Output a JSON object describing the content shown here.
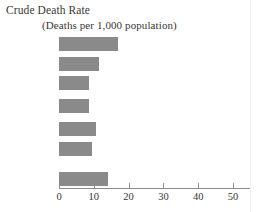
{
  "chart_data": {
    "type": "bar",
    "orientation": "horizontal",
    "title": "Crude Death Rate",
    "subtitle": "(Deaths per 1,000 population)",
    "xlabel": "",
    "ylabel": "",
    "xlim": [
      0,
      55
    ],
    "grid": false,
    "legend": null,
    "xticks": [
      0,
      10,
      20,
      30,
      40,
      50
    ],
    "xtick_labels": [
      "0",
      "10",
      "20",
      "30",
      "40",
      "50"
    ],
    "categories": [
      "Africa",
      "Asia",
      "North America",
      "Latin America",
      "Europe",
      "Oceania",
      "Kenya"
    ],
    "values": [
      17,
      11.5,
      8.5,
      8.5,
      10.5,
      9.5,
      14
    ],
    "bar_color": "#8a8a8a",
    "axis_color": "#8e8a86",
    "text_color": "#3a3633",
    "groups": [
      {
        "name": "regions",
        "categories": [
          "Africa",
          "Asia",
          "North America",
          "Latin America",
          "Europe",
          "Oceania"
        ]
      },
      {
        "name": "country",
        "categories": [
          "Kenya"
        ]
      }
    ]
  },
  "rows": [
    {
      "label_line1": "Africa",
      "label_line2": "",
      "value": 17,
      "two_line": false
    },
    {
      "label_line1": "Asia",
      "label_line2": "",
      "value": 11.5,
      "two_line": false
    },
    {
      "label_line1": "North",
      "label_line2": "America",
      "value": 8.5,
      "two_line": true
    },
    {
      "label_line1": "Latin",
      "label_line2": "America",
      "value": 8.5,
      "two_line": true
    },
    {
      "label_line1": "Europe",
      "label_line2": "",
      "value": 10.5,
      "two_line": false
    },
    {
      "label_line1": "Oceania",
      "label_line2": "",
      "value": 9.5,
      "two_line": false
    },
    {
      "label_line1": "Kenya",
      "label_line2": "",
      "value": 14,
      "two_line": false
    }
  ],
  "axis": {
    "ticks": [
      "0",
      "10",
      "20",
      "30",
      "40",
      "50"
    ]
  }
}
